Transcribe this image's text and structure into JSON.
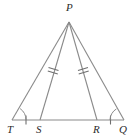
{
  "figure": {
    "kind": "geometry-diagram",
    "stroke_color": "#8a8a8a",
    "label_color": "#2b2b2b",
    "background": "#ffffff",
    "width": 135,
    "height": 139
  },
  "points": {
    "P": {
      "label": "P",
      "x": 69,
      "y": 22,
      "label_x": 66,
      "label_y": 3
    },
    "T": {
      "label": "T",
      "x": 12,
      "y": 120,
      "label_x": 8,
      "label_y": 124
    },
    "S": {
      "label": "S",
      "x": 40,
      "y": 120,
      "label_x": 37,
      "label_y": 124
    },
    "R": {
      "label": "R",
      "x": 97,
      "y": 120,
      "label_x": 94,
      "label_y": 124
    },
    "Q": {
      "label": "Q",
      "x": 124,
      "y": 120,
      "label_x": 120,
      "label_y": 124
    }
  },
  "segments": [
    {
      "name": "P-T",
      "from": "P",
      "to": "T",
      "ticks": 0
    },
    {
      "name": "P-S",
      "from": "P",
      "to": "S",
      "ticks": 2
    },
    {
      "name": "P-R",
      "from": "P",
      "to": "R",
      "ticks": 2
    },
    {
      "name": "P-Q",
      "from": "P",
      "to": "Q",
      "ticks": 0
    },
    {
      "name": "T-S",
      "from": "T",
      "to": "S",
      "ticks": 1
    },
    {
      "name": "S-R",
      "from": "S",
      "to": "R",
      "ticks": 0
    },
    {
      "name": "R-Q",
      "from": "R",
      "to": "Q",
      "ticks": 1
    }
  ],
  "angle_marks": [
    {
      "name": "angle-at-T",
      "vertex": "T",
      "arcs": 1
    },
    {
      "name": "angle-at-Q",
      "vertex": "Q",
      "arcs": 1
    }
  ]
}
